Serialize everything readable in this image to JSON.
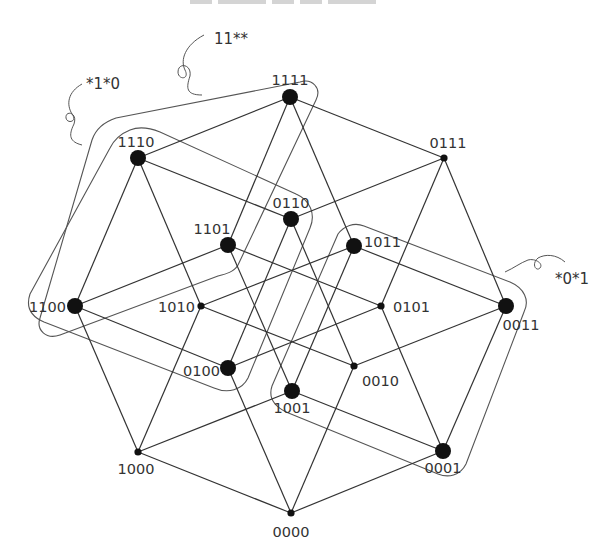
{
  "diagram": {
    "title_clipped": true,
    "colors": {
      "edge": "#333333",
      "outline": "#555555",
      "node": "#111111",
      "label": "#333333",
      "background": "#ffffff"
    },
    "nodes": [
      {
        "id": "0000",
        "label": "0000",
        "x": 291,
        "y": 513,
        "size": "small",
        "label_dx": 0,
        "label_dy": 24,
        "anchor": "middle"
      },
      {
        "id": "1000",
        "label": "1000",
        "x": 138,
        "y": 452,
        "size": "small",
        "label_dx": -2,
        "label_dy": 22,
        "anchor": "middle"
      },
      {
        "id": "0100",
        "label": "0100",
        "x": 228,
        "y": 368,
        "size": "large",
        "label_dx": -8,
        "label_dy": 8,
        "anchor": "end"
      },
      {
        "id": "0010",
        "label": "0010",
        "x": 354,
        "y": 366,
        "size": "small",
        "label_dx": 8,
        "label_dy": 20,
        "anchor": "start"
      },
      {
        "id": "0001",
        "label": "0001",
        "x": 443,
        "y": 451,
        "size": "large",
        "label_dx": 0,
        "label_dy": 22,
        "anchor": "middle"
      },
      {
        "id": "1100",
        "label": "1100",
        "x": 75,
        "y": 306,
        "size": "large",
        "label_dx": -9,
        "label_dy": 6,
        "anchor": "end"
      },
      {
        "id": "1010",
        "label": "1010",
        "x": 201,
        "y": 306,
        "size": "small",
        "label_dx": -6,
        "label_dy": 6,
        "anchor": "end"
      },
      {
        "id": "1001",
        "label": "1001",
        "x": 292,
        "y": 391,
        "size": "large",
        "label_dx": 0,
        "label_dy": 22,
        "anchor": "middle"
      },
      {
        "id": "0110",
        "label": "0110",
        "x": 291,
        "y": 219,
        "size": "large",
        "label_dx": 0,
        "label_dy": -11,
        "anchor": "middle"
      },
      {
        "id": "0101",
        "label": "0101",
        "x": 381,
        "y": 306,
        "size": "small",
        "label_dx": 12,
        "label_dy": 6,
        "anchor": "start"
      },
      {
        "id": "0011",
        "label": "0011",
        "x": 506,
        "y": 306,
        "size": "large",
        "label_dx": 15,
        "label_dy": 24,
        "anchor": "middle"
      },
      {
        "id": "1110",
        "label": "1110",
        "x": 138,
        "y": 158,
        "size": "large",
        "label_dx": -2,
        "label_dy": -11,
        "anchor": "middle"
      },
      {
        "id": "1101",
        "label": "1101",
        "x": 228,
        "y": 245,
        "size": "large",
        "label_dx": -16,
        "label_dy": -11,
        "anchor": "middle"
      },
      {
        "id": "1011",
        "label": "1011",
        "x": 354,
        "y": 246,
        "size": "large",
        "label_dx": 10,
        "label_dy": 1,
        "anchor": "start"
      },
      {
        "id": "0111",
        "label": "0111",
        "x": 444,
        "y": 158,
        "size": "small",
        "label_dx": 4,
        "label_dy": -10,
        "anchor": "middle"
      },
      {
        "id": "1111",
        "label": "1111",
        "x": 290,
        "y": 97,
        "size": "large",
        "label_dx": 0,
        "label_dy": -12,
        "anchor": "middle"
      }
    ],
    "edges": [
      [
        "0000",
        "1000"
      ],
      [
        "0000",
        "0100"
      ],
      [
        "0000",
        "0010"
      ],
      [
        "0000",
        "0001"
      ],
      [
        "1000",
        "1100"
      ],
      [
        "1000",
        "1010"
      ],
      [
        "1000",
        "1001"
      ],
      [
        "0100",
        "1100"
      ],
      [
        "0100",
        "0110"
      ],
      [
        "0100",
        "0101"
      ],
      [
        "0010",
        "1010"
      ],
      [
        "0010",
        "0110"
      ],
      [
        "0010",
        "0011"
      ],
      [
        "0001",
        "1001"
      ],
      [
        "0001",
        "0101"
      ],
      [
        "0001",
        "0011"
      ],
      [
        "1100",
        "1110"
      ],
      [
        "1100",
        "1101"
      ],
      [
        "1010",
        "1110"
      ],
      [
        "1010",
        "1011"
      ],
      [
        "1001",
        "1101"
      ],
      [
        "1001",
        "1011"
      ],
      [
        "0110",
        "1110"
      ],
      [
        "0110",
        "0111"
      ],
      [
        "0101",
        "1101"
      ],
      [
        "0101",
        "0111"
      ],
      [
        "0011",
        "1011"
      ],
      [
        "0011",
        "0111"
      ],
      [
        "1110",
        "1111"
      ],
      [
        "1101",
        "1111"
      ],
      [
        "1011",
        "1111"
      ],
      [
        "0111",
        "1111"
      ]
    ],
    "groups": [
      {
        "name": "11**",
        "members": [
          "1111",
          "1110",
          "1100",
          "1101"
        ],
        "label_x": 214,
        "label_y": 44,
        "leader": "M 204 35 C 185 45, 180 60, 185 70 C 190 80, 178 80, 178 72 C 178 62, 192 64, 190 76 C 186 88, 186 95, 202 95"
      },
      {
        "name": "*1*0",
        "members": [
          "1110",
          "0110",
          "0100",
          "1100"
        ],
        "label_x": 86,
        "label_y": 89,
        "leader": "M 82 84 C 68 92, 66 104, 72 114 C 78 122, 67 124, 66 118 C 65 110, 78 112, 74 124 C 68 136, 70 142, 82 145"
      },
      {
        "name": "*0*1",
        "members": [
          "1011",
          "0011",
          "0001",
          "1001"
        ],
        "label_x": 555,
        "label_y": 284,
        "leader": "M 565 262 C 556 254, 545 254, 538 258 C 531 264, 536 272, 540 268 C 544 263, 534 258, 528 260 C 520 263, 514 268, 505 272"
      }
    ],
    "group_hulls": [
      {
        "name": "11**",
        "path": "M 300 82 C 312 78, 322 88, 316 100 L 238 265 C 234 272, 226 274, 218 276 L 60 335 C 46 340, 36 330, 40 318 L 92 140 C 96 128, 104 122, 116 118 Z"
      },
      {
        "name": "*1*0",
        "path": "M 130 130 C 140 126, 150 128, 160 132 L 296 194 C 310 200, 316 214, 310 228 L 248 378 C 242 390, 228 394, 214 388 L 44 322 C 30 316, 26 306, 30 294 L 110 148 C 114 140, 120 134, 130 130 Z"
      },
      {
        "name": "*0*1",
        "path": "M 338 234 C 344 226, 354 222, 364 226 L 510 282 C 524 288, 530 300, 524 312 L 466 464 C 460 476, 448 478, 438 474 L 286 412 C 274 406, 268 398, 272 386 Z"
      }
    ]
  }
}
